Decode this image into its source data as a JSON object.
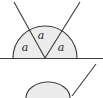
{
  "figure": {
    "background_color": "#ffffff",
    "stroke_color": "#3a3a3a",
    "fill_color": "#ececec",
    "label_color": "#1a1a1a",
    "baseline": {
      "name": "horizontal-baseline",
      "y": 58,
      "x_start": 0,
      "x_end": 103
    },
    "vertex": {
      "x": 45,
      "y": 58
    },
    "semicircle": {
      "radius": 32,
      "left_point_x": 13,
      "right_point_x": 77
    },
    "rays": [
      {
        "name": "left-ray",
        "x1": 45,
        "y1": 58,
        "x2": 14,
        "y2": 2
      },
      {
        "name": "right-ray",
        "x1": 45,
        "y1": 58,
        "x2": 80,
        "y2": 2
      }
    ],
    "angle_labels": [
      {
        "text": "a",
        "x": 25,
        "y": 51
      },
      {
        "text": "a",
        "x": 41,
        "y": 39
      },
      {
        "text": "a",
        "x": 61,
        "y": 51
      }
    ],
    "lower_figure": {
      "name": "partial-second-figure",
      "baseline_y": 94,
      "arc": {
        "cx": 48,
        "cy": 96,
        "rx": 22,
        "ry": 14
      },
      "ray": {
        "x1": 73,
        "y1": 95,
        "x2": 96,
        "y2": 64
      }
    }
  }
}
